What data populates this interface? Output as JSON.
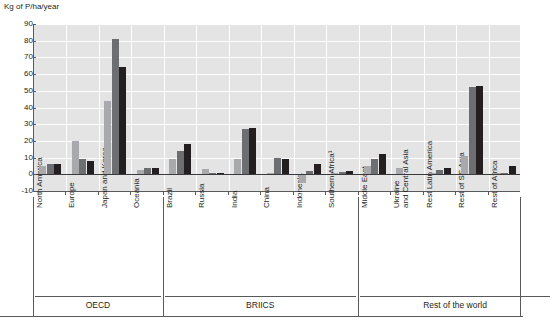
{
  "axis_title": "Kg of P/ha/year",
  "y_ticks": [
    90,
    80,
    70,
    60,
    50,
    40,
    30,
    20,
    10,
    0,
    -10
  ],
  "sections": [
    {
      "label": "OECD",
      "count": 4
    },
    {
      "label": "BRIICS",
      "count": 6
    },
    {
      "label": "Rest of the world",
      "count": 6
    }
  ],
  "series_colors": {
    "series_1": "#a7a9ac",
    "series_2": "#6d6e71",
    "series_3": "#231f20"
  },
  "chart_data": {
    "type": "bar",
    "title": "",
    "subtitle": "",
    "xlabel": "",
    "ylabel": "Kg of P/ha/year",
    "ylim": [
      -10,
      90
    ],
    "ytick_step": 10,
    "grid": true,
    "legend": "none",
    "categories": [
      "North America",
      "Europe",
      "Japan and Korea",
      "Oceania",
      "Brazil",
      "Russia",
      "India",
      "China",
      "Indonesia",
      "Southern Africa¹",
      "Middle East",
      "Ukraine\nand Central Asia",
      "Rest Latin America",
      "Rest of SE Asia",
      "Rest of Africa"
    ],
    "category_groups": [
      "OECD",
      "OECD",
      "OECD",
      "OECD",
      "BRIICS",
      "BRIICS",
      "BRIICS",
      "BRIICS",
      "BRIICS",
      "BRIICS",
      "Rest of the world",
      "Rest of the world",
      "Rest of the world",
      "Rest of the world",
      "Rest of the world"
    ],
    "series": [
      {
        "name": "series_1",
        "color": "#a7a9ac",
        "values": [
          5,
          20,
          44,
          2.5,
          9,
          3,
          9,
          0.5,
          -5,
          1,
          5,
          4,
          1,
          11,
          1
        ]
      },
      {
        "name": "series_2",
        "color": "#6d6e71",
        "values": [
          6,
          9,
          81,
          3.5,
          14,
          0.8,
          27,
          10,
          2,
          1.5,
          9,
          0.4,
          2.5,
          52,
          0.6
        ]
      },
      {
        "name": "series_3",
        "color": "#231f20",
        "values": [
          6,
          8,
          64,
          3.5,
          18,
          0.8,
          28,
          9,
          6,
          2,
          12,
          0.4,
          3.5,
          53,
          5
        ]
      }
    ]
  }
}
